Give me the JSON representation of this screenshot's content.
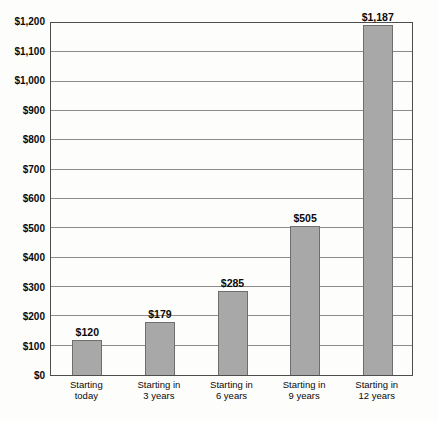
{
  "chart_data": {
    "type": "bar",
    "title": "",
    "xlabel": "",
    "ylabel": "",
    "categories": [
      "Starting today",
      "Starting in 3 years",
      "Starting in 6 years",
      "Starting in 9 years",
      "Starting in 12 years"
    ],
    "category_lines": [
      [
        "Starting",
        "today"
      ],
      [
        "Starting in",
        "3 years"
      ],
      [
        "Starting in",
        "6 years"
      ],
      [
        "Starting in",
        "9 years"
      ],
      [
        "Starting in",
        "12 years"
      ]
    ],
    "values": [
      120,
      179,
      285,
      505,
      1187
    ],
    "value_labels": [
      "$120",
      "$179",
      "$285",
      "$505",
      "$1,187"
    ],
    "y_ticks": [
      "$0",
      "$100",
      "$200",
      "$300",
      "$400",
      "$500",
      "$600",
      "$700",
      "$800",
      "$900",
      "$1,000",
      "$1,100",
      "$1,200"
    ],
    "y_tick_values": [
      0,
      100,
      200,
      300,
      400,
      500,
      600,
      700,
      800,
      900,
      1000,
      1100,
      1200
    ],
    "ylim": [
      0,
      1200
    ],
    "grid": "horizontal",
    "legend": "none",
    "colors": {
      "bar_fill": "#a8a8a8",
      "bar_border": "#6e6e6e",
      "gridline": "#8c8c8c",
      "plot_border": "#4d4d4d",
      "text": "#0a0a0a",
      "background": "#fdfdfc"
    }
  }
}
